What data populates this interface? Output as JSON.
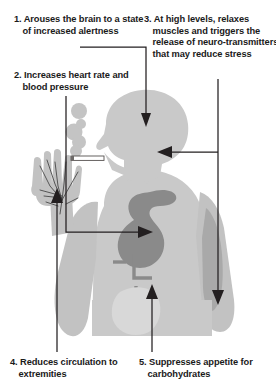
{
  "figure": {
    "background_color": "#ffffff",
    "text_color": "#1a1a1a",
    "body_fill": "#c9c9c9",
    "body_fill_dark": "#b4b4b4",
    "organ_fill": "#8a8a8a",
    "smoke_fill": "#c4c4c4",
    "line_color": "#231f20",
    "cigarette_fill": "#ffffff"
  },
  "callouts": [
    {
      "number": "1.",
      "text": "1. Arouses the brain to a state of increased alertness",
      "target": "brain"
    },
    {
      "number": "2.",
      "text": "2. Increases heart rate and blood pressure",
      "target": "heart"
    },
    {
      "number": "3.",
      "text": "3. At high levels, relaxes muscles and triggers the release of neuro-transmitters that may reduce stress",
      "target": "muscle"
    },
    {
      "number": "4.",
      "text": "4. Reduces circulation to extremities",
      "target": "hand"
    },
    {
      "number": "5.",
      "text": "5. Suppresses appetite for carbohydrates",
      "target": "stomach"
    }
  ],
  "illustration": {
    "subject": "human-torso-smoking-silhouette",
    "parts": [
      "head-profile",
      "smoke-puffs",
      "cigarette",
      "raised-hand",
      "arm-muscle",
      "heart-organ",
      "stomach-organ"
    ]
  }
}
